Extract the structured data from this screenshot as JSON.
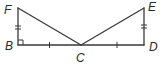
{
  "diagram": {
    "type": "geometry",
    "points": {
      "F": {
        "label": "F",
        "x": 18,
        "y": 8
      },
      "B": {
        "label": "B",
        "x": 18,
        "y": 45
      },
      "C": {
        "label": "C",
        "x": 81,
        "y": 45
      },
      "D": {
        "label": "D",
        "x": 144,
        "y": 45
      },
      "E": {
        "label": "E",
        "x": 144,
        "y": 8
      }
    },
    "segments": [
      {
        "from": "F",
        "to": "B",
        "ticks": 2
      },
      {
        "from": "B",
        "to": "C",
        "ticks": 1
      },
      {
        "from": "C",
        "to": "D",
        "ticks": 1
      },
      {
        "from": "D",
        "to": "E",
        "ticks": 2
      },
      {
        "from": "F",
        "to": "C",
        "ticks": 0
      },
      {
        "from": "E",
        "to": "C",
        "ticks": 0
      }
    ],
    "right_angles": [
      "B"
    ],
    "stroke_color": "#3a3a3a",
    "label_color": "#2a2a2a"
  }
}
